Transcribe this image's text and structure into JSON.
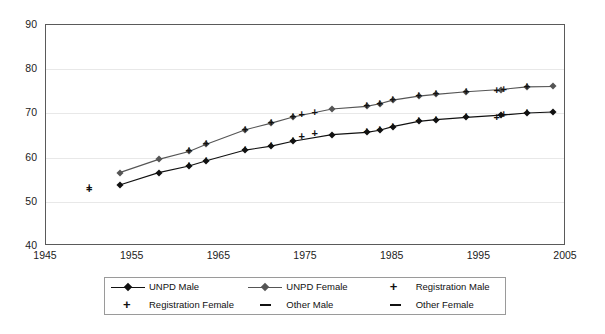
{
  "chart_data": {
    "type": "line",
    "title": "",
    "subtitle": "",
    "xlabel": "",
    "ylabel": "",
    "xlim": [
      1945,
      2005
    ],
    "ylim": [
      40,
      90
    ],
    "x_ticks": [
      1945,
      1955,
      1965,
      1975,
      1985,
      1995,
      2005
    ],
    "y_ticks": [
      40,
      50,
      60,
      70,
      80,
      90
    ],
    "grid": "horizontal-light",
    "legend_position": "bottom-center",
    "legend_entries": [
      "UNPD Male",
      "UNPD Female",
      "Registration Male",
      "Registration Female",
      "Other Male",
      "Other Female"
    ],
    "series": [
      {
        "name": "UNPD Male",
        "marker": "diamond",
        "line": true,
        "color": "#111111",
        "points": [
          [
            1953.5,
            53.8
          ],
          [
            1958.0,
            56.6
          ],
          [
            1961.5,
            58.1
          ],
          [
            1963.5,
            59.3
          ],
          [
            1968.0,
            61.7
          ],
          [
            1971.0,
            62.6
          ],
          [
            1973.5,
            63.7
          ],
          [
            1978.0,
            65.2
          ],
          [
            1982.0,
            65.7
          ],
          [
            1983.5,
            66.2
          ],
          [
            1985.0,
            67.0
          ],
          [
            1988.0,
            68.2
          ],
          [
            1990.0,
            68.6
          ],
          [
            1993.5,
            69.1
          ],
          [
            1997.5,
            69.6
          ],
          [
            2000.5,
            70.1
          ],
          [
            2003.5,
            70.3
          ]
        ]
      },
      {
        "name": "UNPD Female",
        "marker": "diamond",
        "line": true,
        "color": "#555555",
        "points": [
          [
            1953.5,
            56.6
          ],
          [
            1958.0,
            59.6
          ],
          [
            1961.5,
            61.4
          ],
          [
            1963.5,
            63.0
          ],
          [
            1968.0,
            66.3
          ],
          [
            1971.0,
            67.8
          ],
          [
            1973.5,
            69.2
          ],
          [
            1978.0,
            71.0
          ],
          [
            1982.0,
            71.6
          ],
          [
            1983.5,
            72.2
          ],
          [
            1985.0,
            73.0
          ],
          [
            1988.0,
            73.9
          ],
          [
            1990.0,
            74.3
          ],
          [
            1993.5,
            74.9
          ],
          [
            1997.5,
            75.4
          ],
          [
            2000.5,
            76.0
          ],
          [
            2003.5,
            76.1
          ]
        ]
      },
      {
        "name": "Registration Male",
        "marker": "plus",
        "line": false,
        "color": "#111111",
        "points": [
          [
            1950.0,
            52.7
          ],
          [
            1961.5,
            58.1
          ],
          [
            1963.5,
            59.3
          ],
          [
            1968.0,
            61.7
          ],
          [
            1971.0,
            62.6
          ],
          [
            1973.5,
            63.7
          ],
          [
            1974.5,
            64.6
          ],
          [
            1976.0,
            65.3
          ],
          [
            1982.0,
            65.7
          ],
          [
            1983.5,
            66.2
          ],
          [
            1985.0,
            67.0
          ],
          [
            1988.0,
            68.2
          ],
          [
            1990.0,
            68.6
          ],
          [
            1993.5,
            69.1
          ],
          [
            1997.0,
            69.0
          ],
          [
            1997.8,
            69.6
          ],
          [
            2000.5,
            70.1
          ]
        ]
      },
      {
        "name": "Registration Female",
        "marker": "plus",
        "line": false,
        "color": "#111111",
        "points": [
          [
            1950.0,
            53.1
          ],
          [
            1961.5,
            61.4
          ],
          [
            1963.5,
            63.0
          ],
          [
            1968.0,
            66.3
          ],
          [
            1971.0,
            67.8
          ],
          [
            1973.5,
            69.2
          ],
          [
            1974.5,
            69.6
          ],
          [
            1976.0,
            70.0
          ],
          [
            1982.0,
            71.6
          ],
          [
            1983.5,
            72.2
          ],
          [
            1985.0,
            73.0
          ],
          [
            1988.0,
            73.9
          ],
          [
            1990.0,
            74.3
          ],
          [
            1993.5,
            74.9
          ],
          [
            1997.0,
            75.0
          ],
          [
            1997.8,
            75.4
          ],
          [
            2000.5,
            76.0
          ]
        ]
      },
      {
        "name": "Other Male",
        "marker": "dash",
        "line": false,
        "color": "#111111",
        "points": []
      },
      {
        "name": "Other Female",
        "marker": "dash",
        "line": false,
        "color": "#111111",
        "points": []
      }
    ]
  },
  "legend": {
    "items": [
      {
        "label": "UNPD Male",
        "key": "line-diamond-black",
        "color": "#111111"
      },
      {
        "label": "UNPD Female",
        "key": "line-diamond-gray",
        "color": "#555555"
      },
      {
        "label": "Registration Male",
        "key": "plus",
        "color": "#111111"
      },
      {
        "label": "Registration Female",
        "key": "plus",
        "color": "#111111"
      },
      {
        "label": "Other Male",
        "key": "dash",
        "color": "#111111"
      },
      {
        "label": "Other Female",
        "key": "dash",
        "color": "#111111"
      }
    ]
  },
  "axes": {
    "y_tick_labels": [
      "90",
      "80",
      "70",
      "60",
      "50",
      "40"
    ],
    "x_tick_labels": [
      "1945",
      "1955",
      "1965",
      "1975",
      "1985",
      "1995",
      "2005"
    ]
  }
}
